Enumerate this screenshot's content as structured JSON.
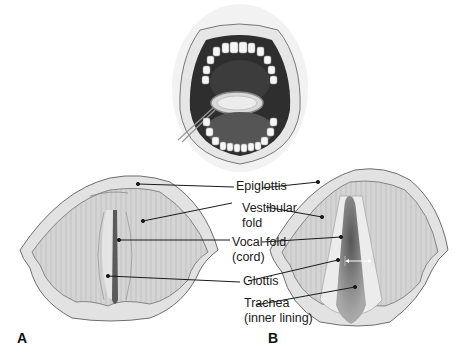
{
  "diagram": {
    "panels": [
      {
        "id": "A",
        "label": "A"
      },
      {
        "id": "B",
        "label": "B"
      }
    ],
    "labels": {
      "epiglottis": "Epiglottis",
      "vestibular_fold_1": "Vestibular",
      "vestibular_fold_2": "fold",
      "vocal_fold_1": "Vocal fold",
      "vocal_fold_2": "(cord)",
      "glottis": "Glottis",
      "trachea_1": "Trachea",
      "trachea_2": "(inner lining)"
    },
    "colors": {
      "tissue": "#d6d6d6",
      "tissue_edge": "#6e6e6e",
      "rim": "#e4e4e4",
      "glottis_dark": "#5a5a5a",
      "mouth_dark": "#3a3a3a",
      "teeth": "#f4f4f4",
      "leader_line": "#1a1a1a"
    }
  }
}
